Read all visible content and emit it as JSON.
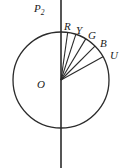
{
  "figure": {
    "type": "geometric-diagram",
    "background_color": "#ffffff",
    "stroke_color": "#2b2b2b",
    "geometry": {
      "center": {
        "x": 61,
        "y": 80
      },
      "radius": 48,
      "axis": {
        "x": 61,
        "y_top": 0,
        "y_bottom": 168
      }
    },
    "labels": {
      "axis": {
        "text": "P",
        "subscript": "2"
      },
      "center": "O"
    },
    "rays": [
      {
        "name": "R",
        "label": "R",
        "angle_deg": 82
      },
      {
        "name": "Y",
        "label": "Y",
        "angle_deg": 72
      },
      {
        "name": "G",
        "label": "G",
        "angle_deg": 59
      },
      {
        "name": "B",
        "label": "B",
        "angle_deg": 45
      },
      {
        "name": "U",
        "label": "U",
        "angle_deg": 29
      }
    ]
  }
}
